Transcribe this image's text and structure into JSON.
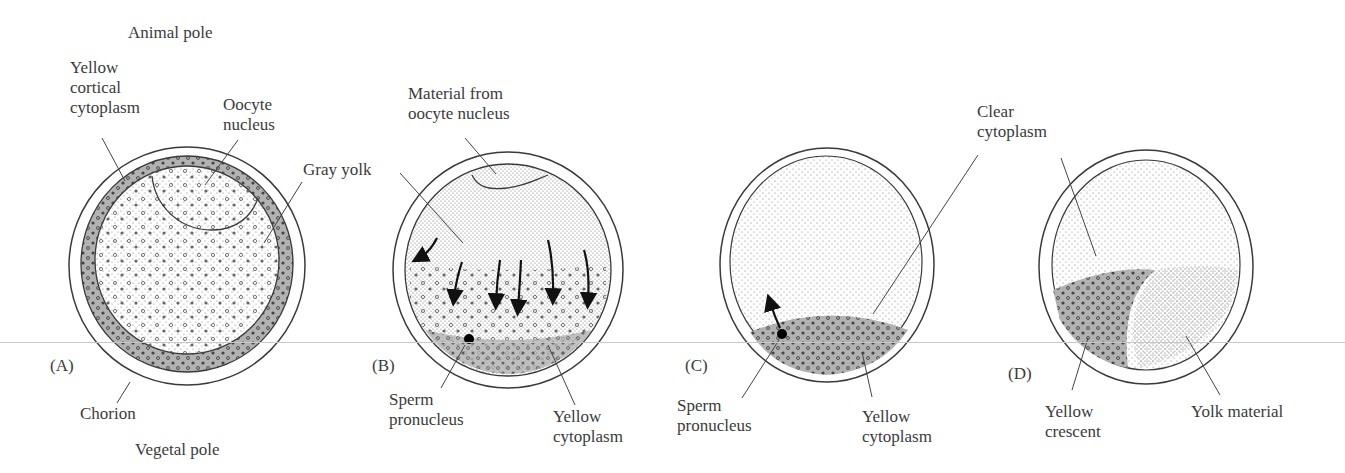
{
  "figure": {
    "panels": [
      {
        "id": "A",
        "tag": "(A)",
        "labels": {
          "animal_pole": "Animal pole",
          "yellow_cortical": "Yellow\ncortical\ncytoplasm",
          "oocyte_nucleus": "Oocyte\nnucleus",
          "gray_yolk": "Gray yolk",
          "chorion": "Chorion",
          "vegetal_pole": "Vegetal pole"
        }
      },
      {
        "id": "B",
        "tag": "(B)",
        "labels": {
          "material": "Material from\noocyte nucleus",
          "sperm": "Sperm\npronucleus",
          "yellow_cyto": "Yellow\ncytoplasm"
        }
      },
      {
        "id": "C",
        "tag": "(C)",
        "labels": {
          "clear": "Clear\ncytoplasm",
          "sperm": "Sperm\npronucleus",
          "yellow_cyto": "Yellow\ncytoplasm"
        }
      },
      {
        "id": "D",
        "tag": "(D)",
        "labels": {
          "yellow_crescent": "Yellow\ncrescent",
          "yolk_material": "Yolk material"
        }
      }
    ],
    "colors": {
      "outline": "#3a3a3a",
      "cortical_gray": "#b4b4b4",
      "stipple": "#6e6e6e",
      "background": "#ffffff"
    }
  }
}
